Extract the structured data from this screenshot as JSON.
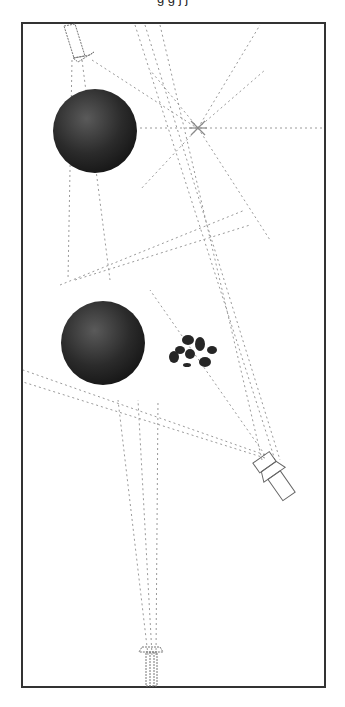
{
  "caption": {
    "text": "g g   j   j",
    "note": "top text line clipped; only descenders visible"
  },
  "scene": {
    "frame": {
      "x": 21,
      "y": 22,
      "w": 305,
      "h": 666,
      "border_color": "#333333"
    },
    "spheres": [
      {
        "id": "sphere-top",
        "cx": 95,
        "cy": 131,
        "r": 42,
        "color": "#2a2a2a"
      },
      {
        "id": "sphere-bottom",
        "cx": 103,
        "cy": 343,
        "r": 42,
        "color": "#2e2e2e"
      }
    ],
    "rocks": {
      "cx": 190,
      "cy": 350,
      "color": "#262626"
    },
    "light_star": {
      "cx": 198,
      "cy": 128
    },
    "devices": [
      {
        "id": "spotlight-top",
        "x": 72,
        "y": 30
      },
      {
        "id": "camera-right",
        "x": 270,
        "y": 460
      },
      {
        "id": "camera-bottom",
        "x": 152,
        "y": 670
      }
    ],
    "line_color": "#9a9a9a"
  }
}
